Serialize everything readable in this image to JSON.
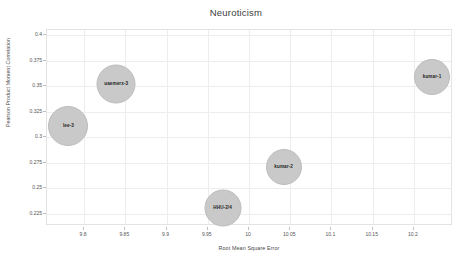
{
  "chart_data": {
    "type": "scatter",
    "title": "Neuroticism",
    "xlabel": "Root Mean Square Error",
    "ylabel": "Pearson Product Moment Correlation",
    "xlim": [
      9.755,
      10.245
    ],
    "ylim": [
      0.215,
      0.405
    ],
    "xticks": [
      "9.8",
      "9.85",
      "9.9",
      "9.95",
      "10",
      "10.05",
      "10.1",
      "10.15",
      "10.2"
    ],
    "xtick_values": [
      9.8,
      9.85,
      9.9,
      9.95,
      10.0,
      10.05,
      10.1,
      10.15,
      10.2
    ],
    "yticks": [
      "0.225",
      "0.25",
      "0.275",
      "0.3",
      "0.325",
      "0.35",
      "0.375",
      "0.4"
    ],
    "ytick_values": [
      0.225,
      0.25,
      0.275,
      0.3,
      0.325,
      0.35,
      0.375,
      0.4
    ],
    "grid": true,
    "legend": "none",
    "bubble_color": "#c9c9c9",
    "points": [
      {
        "label": "lee-3",
        "x": 9.781,
        "y": 0.311,
        "size": 38
      },
      {
        "label": "uaemerx-3",
        "x": 9.839,
        "y": 0.352,
        "size": 37
      },
      {
        "label": "HHU-2/4",
        "x": 9.968,
        "y": 0.231,
        "size": 35
      },
      {
        "label": "kumar-2",
        "x": 10.042,
        "y": 0.271,
        "size": 34
      },
      {
        "label": "kumar-1",
        "x": 10.222,
        "y": 0.359,
        "size": 34
      }
    ]
  }
}
